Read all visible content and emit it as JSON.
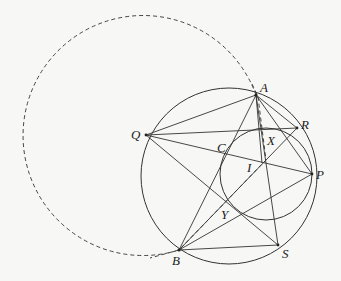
{
  "diagram": {
    "labels": {
      "A": "A",
      "Q": "Q",
      "R": "R",
      "C": "C",
      "X": "X",
      "I": "I",
      "P": "P",
      "Y": "Y",
      "B": "B",
      "S": "S"
    },
    "points": {
      "A": [
        256,
        95
      ],
      "Q": [
        146,
        135
      ],
      "R": [
        297,
        128
      ],
      "P": [
        312,
        174
      ],
      "B": [
        179,
        250
      ],
      "S": [
        278,
        245
      ],
      "I": [
        265,
        163
      ],
      "C": [
        229,
        150
      ],
      "Y": [
        230,
        205
      ],
      "X": [
        270,
        133
      ]
    },
    "circles": [
      {
        "name": "circumcircle",
        "cx": 229,
        "cy": 176,
        "r": 88,
        "style": "solid"
      },
      {
        "name": "inner-circle",
        "cx": 266,
        "cy": 174,
        "r": 46,
        "style": "solid"
      },
      {
        "name": "dashed-circle",
        "cx": 145,
        "cy": 148,
        "r": 120,
        "style": "dashed"
      }
    ],
    "segments": [
      [
        "A",
        "Q"
      ],
      [
        "A",
        "R"
      ],
      [
        "A",
        "P"
      ],
      [
        "A",
        "B"
      ],
      [
        "A",
        "S"
      ],
      [
        "A",
        "I"
      ],
      [
        "Q",
        "R"
      ],
      [
        "Q",
        "P"
      ],
      [
        "Q",
        "S"
      ],
      [
        "B",
        "P"
      ],
      [
        "B",
        "R"
      ],
      [
        "B",
        "S"
      ],
      [
        "R",
        "P"
      ]
    ],
    "dashed_segments": [
      [
        "A",
        "B"
      ]
    ]
  }
}
